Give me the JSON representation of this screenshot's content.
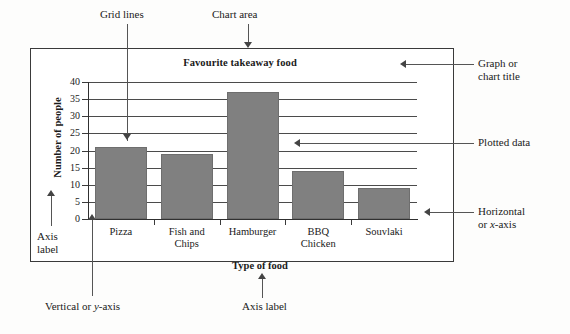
{
  "chart_data": {
    "type": "bar",
    "title": "Favourite takeaway food",
    "xlabel": "Type of food",
    "ylabel": "Number of people",
    "categories": [
      "Pizza",
      "Fish and Chips",
      "Hamburger",
      "BBQ Chicken",
      "Souvlaki"
    ],
    "values": [
      21,
      19,
      37,
      14,
      9
    ],
    "ylim": [
      0,
      40
    ],
    "yticks": [
      0,
      5,
      10,
      15,
      20,
      25,
      30,
      35,
      40
    ],
    "grid": true,
    "legend": "none",
    "bar_color": "#808080",
    "axis_color": "#303030"
  },
  "category_lines": [
    [
      "Pizza"
    ],
    [
      "Fish and",
      "Chips"
    ],
    [
      "Hamburger"
    ],
    [
      "BBQ",
      "Chicken"
    ],
    [
      "Souvlaki"
    ]
  ],
  "annotations": {
    "grid_lines": "Grid lines",
    "chart_area": "Chart area",
    "graph_title_1": "Graph or",
    "graph_title_2": "chart title",
    "plotted_data": "Plotted data",
    "horizontal_axis_1": "Horizontal",
    "horizontal_axis_2": "or x-axis",
    "axis_label_left_1": "Axis",
    "axis_label_left_2": "label",
    "vertical_axis": "Vertical or y-axis",
    "axis_label_bottom": "Axis label"
  }
}
